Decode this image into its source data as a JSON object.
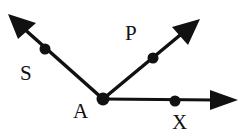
{
  "diagram": {
    "type": "geometry-rays",
    "vertex": {
      "label": "A",
      "x": 103,
      "y": 99
    },
    "rays": [
      {
        "name": "ray-AS",
        "point_label": "S",
        "tip": [
          8,
          14
        ],
        "dot": [
          45,
          49
        ],
        "label_pos": [
          20,
          80
        ]
      },
      {
        "name": "ray-AP",
        "point_label": "P",
        "tip": [
          200,
          19
        ],
        "dot": [
          153,
          58
        ],
        "label_pos": [
          125,
          40
        ]
      },
      {
        "name": "ray-AX",
        "point_label": "X",
        "tip": [
          238,
          100
        ],
        "dot": [
          175,
          101
        ],
        "label_pos": [
          172,
          129
        ]
      }
    ],
    "labels": {
      "S": "S",
      "P": "P",
      "A": "A",
      "X": "X"
    },
    "colors": {
      "stroke": "#111111",
      "background": "#ffffff"
    }
  }
}
